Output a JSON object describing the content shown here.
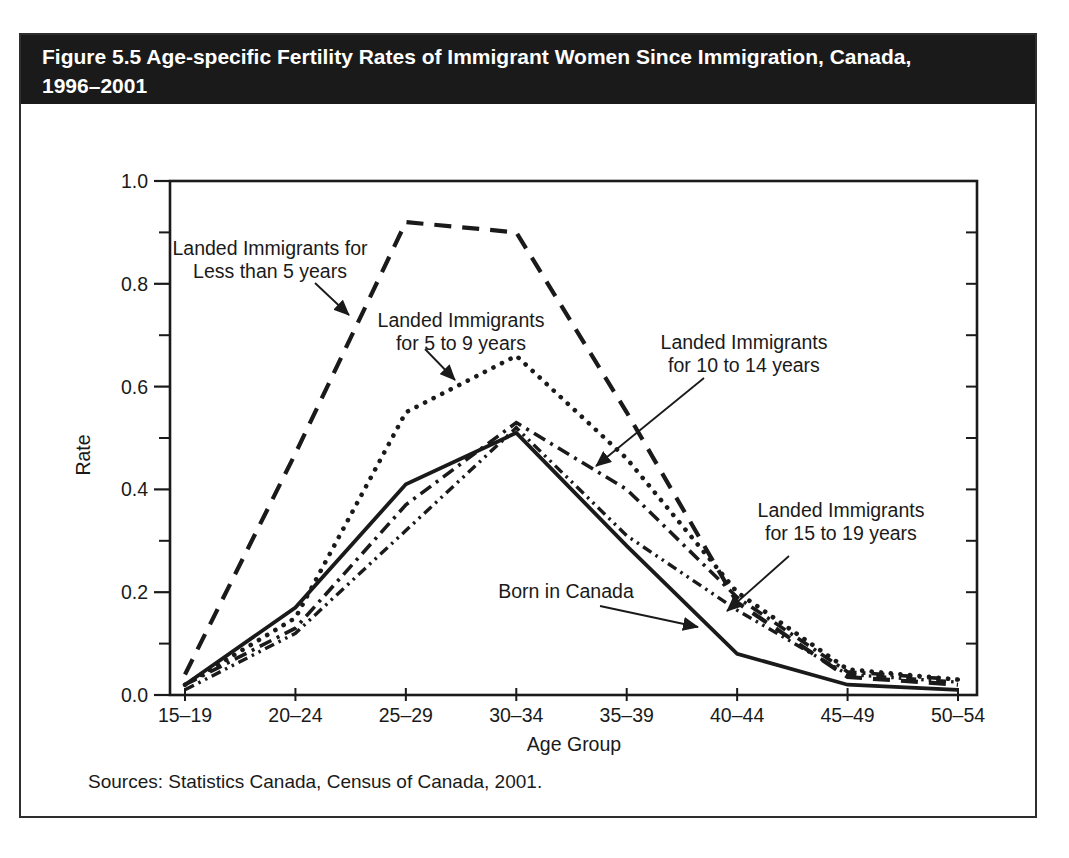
{
  "figure": {
    "title_line1": "Figure 5.5 Age-specific Fertility Rates of Immigrant Women Since Immigration, Canada,",
    "title_line2": "1996–2001",
    "source": "Sources: Statistics Canada, Census of Canada, 2001."
  },
  "colors": {
    "ink": "#1a1a1a",
    "banner_bg": "#1a1a1a",
    "banner_text": "#ffffff",
    "page_bg": "#ffffff"
  },
  "chart_data": {
    "type": "line",
    "title": "Figure 5.5 Age-specific Fertility Rates of Immigrant Women Since Immigration, Canada, 1996–2001",
    "xlabel": "Age Group",
    "ylabel": "Rate",
    "ylim": [
      0.0,
      1.0
    ],
    "grid": false,
    "legend": "inline-annotations-with-arrows",
    "y_major_ticks": [
      0.0,
      0.2,
      0.4,
      0.6,
      0.8,
      1.0
    ],
    "y_tick_labels": [
      "0.0",
      "0.2",
      "0.4",
      "0.6",
      "0.8",
      "1.0"
    ],
    "y_minor_ticks": [
      0.1,
      0.3,
      0.5,
      0.7,
      0.9
    ],
    "categories": [
      "15–19",
      "20–24",
      "25–29",
      "30–34",
      "35–39",
      "40–44",
      "45–49",
      "50–54"
    ],
    "series": [
      {
        "key": "lt5",
        "name": "Landed Immigrants for Less than 5 years",
        "dash": "long-dash",
        "values": [
          0.04,
          0.47,
          0.92,
          0.9,
          0.55,
          0.18,
          0.035,
          0.02
        ]
      },
      {
        "key": "y5to9",
        "name": "Landed Immigrants for 5 to 9 years",
        "dash": "dotted",
        "values": [
          0.02,
          0.15,
          0.55,
          0.66,
          0.46,
          0.2,
          0.05,
          0.03
        ]
      },
      {
        "key": "y10to14",
        "name": "Landed Immigrants for 10 to 14 years",
        "dash": "dash-dot",
        "values": [
          0.02,
          0.13,
          0.37,
          0.53,
          0.4,
          0.19,
          0.045,
          0.03
        ]
      },
      {
        "key": "y15to19",
        "name": "Landed Immigrants for 15 to 19 years",
        "dash": "dash-dot-dot",
        "values": [
          0.01,
          0.12,
          0.32,
          0.52,
          0.31,
          0.165,
          0.04,
          0.025
        ]
      },
      {
        "key": "born",
        "name": "Born in Canada",
        "dash": "solid",
        "values": [
          0.02,
          0.17,
          0.41,
          0.51,
          0.29,
          0.08,
          0.02,
          0.01
        ]
      }
    ],
    "annotations": [
      {
        "series": "lt5",
        "lines": [
          "Landed Immigrants for",
          "Less than 5 years"
        ],
        "cx": 270,
        "y": 255,
        "arrow": {
          "x1": 315,
          "y1": 283,
          "x2": 349,
          "y2": 315
        }
      },
      {
        "series": "y5to9",
        "lines": [
          "Landed Immigrants",
          "for 5 to 9 years"
        ],
        "cx": 461,
        "y": 327,
        "arrow": {
          "x1": 425,
          "y1": 349,
          "x2": 455,
          "y2": 380
        }
      },
      {
        "series": "y10to14",
        "lines": [
          "Landed Immigrants",
          "for 10 to 14 years"
        ],
        "cx": 744,
        "y": 349,
        "arrow": {
          "x1": 704,
          "y1": 378,
          "x2": 596,
          "y2": 466
        }
      },
      {
        "series": "y15to19",
        "lines": [
          "Landed Immigrants",
          "for 15 to 19 years"
        ],
        "cx": 841,
        "y": 517,
        "arrow": {
          "x1": 789,
          "y1": 556,
          "x2": 727,
          "y2": 611
        }
      },
      {
        "series": "born",
        "lines": [
          "Born in Canada"
        ],
        "cx": 566,
        "y": 598,
        "arrow": {
          "x1": 600,
          "y1": 606,
          "x2": 698,
          "y2": 627
        }
      }
    ]
  }
}
